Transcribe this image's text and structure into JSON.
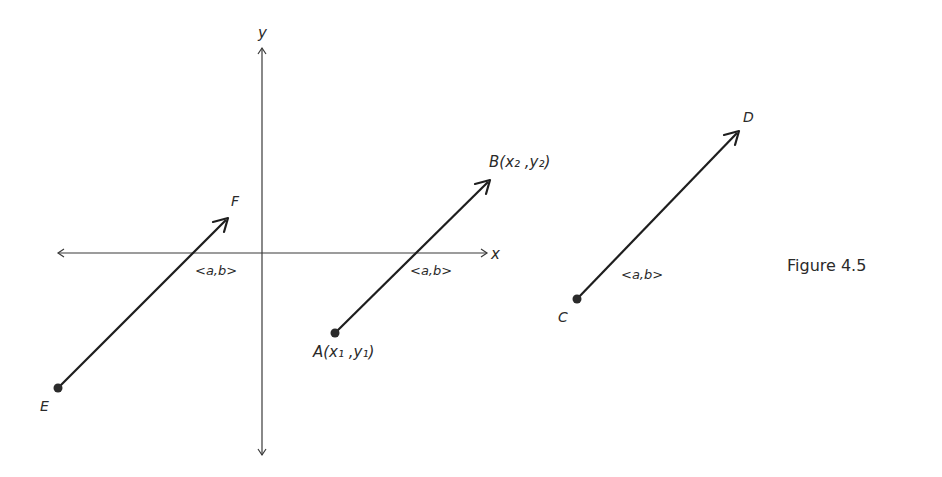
{
  "figure": {
    "caption": "Figure 4.5",
    "axes": {
      "x_label": "x",
      "y_label": "y"
    },
    "vectors": [
      {
        "id": "EF",
        "tail_label": "E",
        "head_label": "F",
        "component_label": "<a,b>",
        "tail": [
          58,
          388
        ],
        "head": [
          228,
          218
        ]
      },
      {
        "id": "AB",
        "tail_label": "A",
        "tail_coords": "(x₁ ,y₁)",
        "head_label": "B",
        "head_coords": "(x₂ ,y₂)",
        "component_label": "<a,b>",
        "tail": [
          335,
          333
        ],
        "head": [
          490,
          180
        ]
      },
      {
        "id": "CD",
        "tail_label": "C",
        "head_label": "D",
        "component_label": "<a,b>",
        "tail": [
          577,
          299
        ],
        "head": [
          739,
          131
        ]
      }
    ]
  }
}
